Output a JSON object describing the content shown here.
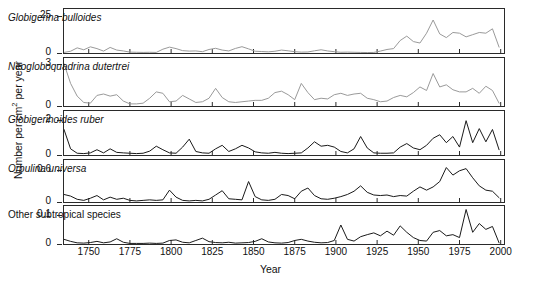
{
  "chart_data": {
    "type": "line",
    "title": "",
    "xlabel": "Year",
    "ylabel_text": "Number per cm",
    "ylabel_sup": "2",
    "ylabel_tail": " per year",
    "xlim": [
      1735,
      2002
    ],
    "xticks": [
      1750,
      1775,
      1800,
      1825,
      1850,
      1875,
      1900,
      1925,
      1950,
      1975,
      2000
    ],
    "grid": false,
    "legend": "none",
    "panels": [
      {
        "label": "Globigerina bulloides",
        "italic": true,
        "color": "#9a9a9a",
        "ylim": [
          0,
          30
        ],
        "yticks": [
          0,
          25
        ],
        "ytick_labels": [
          "0",
          "25"
        ],
        "x": [
          1735,
          1739,
          1743,
          1747,
          1751,
          1755,
          1759,
          1763,
          1767,
          1771,
          1775,
          1779,
          1783,
          1787,
          1791,
          1795,
          1799,
          1803,
          1807,
          1811,
          1815,
          1819,
          1823,
          1827,
          1831,
          1835,
          1839,
          1843,
          1847,
          1851,
          1855,
          1859,
          1863,
          1867,
          1871,
          1875,
          1879,
          1883,
          1887,
          1891,
          1895,
          1899,
          1903,
          1907,
          1911,
          1915,
          1919,
          1923,
          1927,
          1931,
          1935,
          1939,
          1943,
          1947,
          1951,
          1955,
          1959,
          1963,
          1967,
          1971,
          1975,
          1979,
          1983,
          1987,
          1991,
          1995,
          1999
        ],
        "y": [
          0.4,
          1.2,
          3.5,
          2.2,
          4.2,
          3.0,
          1.3,
          3.8,
          2.0,
          1.4,
          0.6,
          0.5,
          0.4,
          0.5,
          0.4,
          2.6,
          4.0,
          3.0,
          1.6,
          1.3,
          1.4,
          0.9,
          2.4,
          3.2,
          2.0,
          1.4,
          3.1,
          4.3,
          2.8,
          1.2,
          1.0,
          0.8,
          1.2,
          2.0,
          1.5,
          0.9,
          0.6,
          0.7,
          1.5,
          2.2,
          1.4,
          0.9,
          0.5,
          0.6,
          0.5,
          0.4,
          0.3,
          0.4,
          1.3,
          2.4,
          3.0,
          8.5,
          11.5,
          7.8,
          6.8,
          13.5,
          22.5,
          13.0,
          10.5,
          14.0,
          13.5,
          11.0,
          12.5,
          14.0,
          13.5,
          16.5,
          4.0
        ]
      },
      {
        "label": "Neogloboquadrina dutertrei",
        "italic": true,
        "color": "#9a9a9a",
        "ylim": [
          0,
          3.4
        ],
        "yticks": [
          0,
          3
        ],
        "ytick_labels": [
          "0",
          "3"
        ],
        "x": [
          1735,
          1739,
          1743,
          1747,
          1751,
          1755,
          1759,
          1763,
          1767,
          1771,
          1775,
          1779,
          1783,
          1787,
          1791,
          1795,
          1799,
          1803,
          1807,
          1811,
          1815,
          1819,
          1823,
          1827,
          1831,
          1835,
          1839,
          1843,
          1847,
          1851,
          1855,
          1859,
          1863,
          1867,
          1871,
          1875,
          1879,
          1883,
          1887,
          1891,
          1895,
          1899,
          1903,
          1907,
          1911,
          1915,
          1919,
          1923,
          1927,
          1931,
          1935,
          1939,
          1943,
          1947,
          1951,
          1955,
          1959,
          1963,
          1967,
          1971,
          1975,
          1979,
          1983,
          1987,
          1991,
          1995,
          1999
        ],
        "y": [
          3.0,
          1.6,
          0.7,
          0.25,
          0.2,
          0.75,
          0.85,
          0.7,
          0.8,
          0.35,
          0.15,
          0.15,
          0.2,
          0.55,
          1.0,
          0.9,
          0.3,
          0.35,
          0.75,
          0.5,
          0.25,
          0.3,
          0.55,
          1.25,
          0.6,
          0.3,
          0.25,
          0.3,
          0.35,
          0.4,
          0.4,
          0.55,
          0.95,
          1.05,
          0.8,
          0.45,
          1.6,
          0.95,
          0.45,
          0.55,
          0.5,
          0.8,
          0.9,
          0.75,
          0.85,
          0.9,
          0.55,
          0.45,
          0.3,
          0.35,
          0.6,
          0.75,
          0.65,
          0.95,
          1.35,
          1.1,
          2.3,
          1.35,
          1.5,
          1.15,
          1.0,
          1.0,
          1.25,
          0.9,
          1.4,
          1.1,
          0.2
        ]
      },
      {
        "label": "Globigerinoides ruber",
        "italic": true,
        "color": "#1a1a1a",
        "ylim": [
          0,
          2.5
        ],
        "yticks": [
          0,
          2
        ],
        "ytick_labels": [
          "0",
          "2"
        ],
        "x": [
          1735,
          1739,
          1743,
          1747,
          1751,
          1755,
          1759,
          1763,
          1767,
          1771,
          1775,
          1779,
          1783,
          1787,
          1791,
          1795,
          1799,
          1803,
          1807,
          1811,
          1815,
          1819,
          1823,
          1827,
          1831,
          1835,
          1839,
          1843,
          1847,
          1851,
          1855,
          1859,
          1863,
          1867,
          1871,
          1875,
          1879,
          1883,
          1887,
          1891,
          1895,
          1899,
          1903,
          1907,
          1911,
          1915,
          1919,
          1923,
          1927,
          1931,
          1935,
          1939,
          1943,
          1947,
          1951,
          1955,
          1959,
          1963,
          1967,
          1971,
          1975,
          1979,
          1983,
          1987,
          1991,
          1995,
          1999
        ],
        "y": [
          1.45,
          0.35,
          0.1,
          0.08,
          0.12,
          0.3,
          0.12,
          0.35,
          0.15,
          0.12,
          0.1,
          0.08,
          0.1,
          0.22,
          0.5,
          0.3,
          0.12,
          0.1,
          0.45,
          0.9,
          0.2,
          0.12,
          0.1,
          0.35,
          0.55,
          0.2,
          0.35,
          0.55,
          0.4,
          0.18,
          0.12,
          0.1,
          0.15,
          0.1,
          0.08,
          0.1,
          0.12,
          0.4,
          0.75,
          0.5,
          0.55,
          0.45,
          0.2,
          0.12,
          0.35,
          1.05,
          0.4,
          0.12,
          0.1,
          0.1,
          0.12,
          0.45,
          0.65,
          0.4,
          0.3,
          0.55,
          0.95,
          1.15,
          0.7,
          1.05,
          0.45,
          1.95,
          0.7,
          1.5,
          0.75,
          1.45,
          0.3
        ]
      },
      {
        "label": "Orbulina universa",
        "italic": true,
        "color": "#1a1a1a",
        "ylim": [
          0,
          0.78
        ],
        "yticks": [
          0,
          0.6
        ],
        "ytick_labels": [
          "0",
          "0.6"
        ],
        "x": [
          1735,
          1739,
          1743,
          1747,
          1751,
          1755,
          1759,
          1763,
          1767,
          1771,
          1775,
          1779,
          1783,
          1787,
          1791,
          1795,
          1799,
          1803,
          1807,
          1811,
          1815,
          1819,
          1823,
          1827,
          1831,
          1835,
          1839,
          1843,
          1847,
          1851,
          1855,
          1859,
          1863,
          1867,
          1871,
          1875,
          1879,
          1883,
          1887,
          1891,
          1895,
          1899,
          1903,
          1907,
          1911,
          1915,
          1919,
          1923,
          1927,
          1931,
          1935,
          1939,
          1943,
          1947,
          1951,
          1955,
          1959,
          1963,
          1967,
          1971,
          1975,
          1979,
          1983,
          1987,
          1991,
          1995,
          1999
        ],
        "y": [
          0.14,
          0.11,
          0.05,
          0.03,
          0.07,
          0.12,
          0.04,
          0.09,
          0.05,
          0.07,
          0.03,
          0.02,
          0.03,
          0.04,
          0.03,
          0.04,
          0.22,
          0.09,
          0.03,
          0.02,
          0.03,
          0.02,
          0.05,
          0.13,
          0.21,
          0.06,
          0.05,
          0.04,
          0.38,
          0.1,
          0.04,
          0.03,
          0.05,
          0.14,
          0.12,
          0.06,
          0.2,
          0.26,
          0.12,
          0.06,
          0.05,
          0.07,
          0.1,
          0.14,
          0.2,
          0.3,
          0.18,
          0.13,
          0.12,
          0.13,
          0.1,
          0.12,
          0.11,
          0.2,
          0.28,
          0.22,
          0.28,
          0.38,
          0.64,
          0.5,
          0.58,
          0.62,
          0.45,
          0.3,
          0.22,
          0.2,
          0.08
        ]
      },
      {
        "label": "Other subtropical species",
        "italic": false,
        "color": "#1a1a1a",
        "ylim": [
          0,
          0.13
        ],
        "yticks": [
          0,
          0.1
        ],
        "ytick_labels": [
          "0",
          "0.1"
        ],
        "x": [
          1735,
          1739,
          1743,
          1747,
          1751,
          1755,
          1759,
          1763,
          1767,
          1771,
          1775,
          1779,
          1783,
          1787,
          1791,
          1795,
          1799,
          1803,
          1807,
          1811,
          1815,
          1819,
          1823,
          1827,
          1831,
          1835,
          1839,
          1843,
          1847,
          1851,
          1855,
          1859,
          1863,
          1867,
          1871,
          1875,
          1879,
          1883,
          1887,
          1891,
          1895,
          1899,
          1903,
          1907,
          1911,
          1915,
          1919,
          1923,
          1927,
          1931,
          1935,
          1939,
          1943,
          1947,
          1951,
          1955,
          1959,
          1963,
          1967,
          1971,
          1975,
          1979,
          1983,
          1987,
          1991,
          1995,
          1999
        ],
        "y": [
          0.016,
          0.009,
          0.004,
          0.003,
          0.005,
          0.009,
          0.004,
          0.007,
          0.018,
          0.006,
          0.002,
          0.002,
          0.002,
          0.003,
          0.002,
          0.003,
          0.012,
          0.014,
          0.006,
          0.004,
          0.012,
          0.02,
          0.008,
          0.005,
          0.004,
          0.006,
          0.003,
          0.004,
          0.005,
          0.009,
          0.018,
          0.007,
          0.004,
          0.003,
          0.005,
          0.012,
          0.016,
          0.01,
          0.006,
          0.004,
          0.005,
          0.012,
          0.065,
          0.016,
          0.01,
          0.025,
          0.032,
          0.038,
          0.028,
          0.044,
          0.03,
          0.062,
          0.04,
          0.022,
          0.012,
          0.01,
          0.04,
          0.046,
          0.028,
          0.032,
          0.022,
          0.118,
          0.04,
          0.07,
          0.05,
          0.06,
          0.004
        ]
      }
    ]
  }
}
